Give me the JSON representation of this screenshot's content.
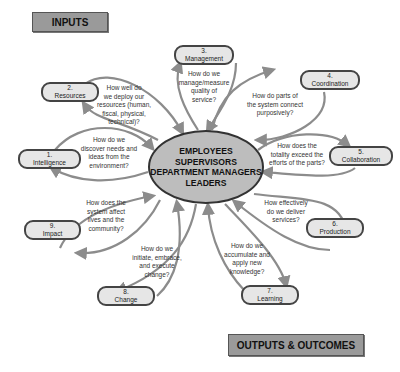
{
  "banners": {
    "inputs": "INPUTS",
    "outputs": "OUTPUTS & OUTCOMES"
  },
  "hub": {
    "lines": [
      "EMPLOYEES",
      "SUPERVISORS",
      "DEPARTMENT MANAGERS",
      "LEADERS"
    ]
  },
  "nodes": [
    {
      "num": "1.",
      "label": "Intelligence",
      "question": "How do we discover needs and ideas from the environment?"
    },
    {
      "num": "2.",
      "label": "Resources",
      "question": "How well do we deploy our resources (human, fiscal, physical, technical)?"
    },
    {
      "num": "3.",
      "label": "Management",
      "question": "How do we manage/measure quality of service?"
    },
    {
      "num": "4.",
      "label": "Coordination",
      "question": "How do parts of the system connect purposively?"
    },
    {
      "num": "5.",
      "label": "Collaboration",
      "question": "How does the totality exceed the efforts of the parts?"
    },
    {
      "num": "6.",
      "label": "Production",
      "question": "How effectively do we deliver services?"
    },
    {
      "num": "7.",
      "label": "Learning",
      "question": "How do we accumulate and apply new knowledge?"
    },
    {
      "num": "8.",
      "label": "Change",
      "question": "How do we initiate, embrace, and execute change?"
    },
    {
      "num": "9.",
      "label": "Impact",
      "question": "How does the system affect lives and the community?"
    }
  ],
  "questions_lines": {
    "q1": [
      "How do we",
      "discover needs and",
      "ideas from the",
      "environment?"
    ],
    "q2": [
      "How well do",
      "we deploy our",
      "resources (human,",
      "fiscal, physical,",
      "technical)?"
    ],
    "q3": [
      "How do we",
      "manage/measure",
      "quality of",
      "service?"
    ],
    "q4": [
      "How do parts of",
      "the system connect",
      "purposively?"
    ],
    "q5": [
      "How does the",
      "totality exceed the",
      "efforts of the parts?"
    ],
    "q6": [
      "How effectively",
      "do we deliver",
      "services?"
    ],
    "q7": [
      "How do we",
      "accumulate and",
      "apply new",
      "knowledge?"
    ],
    "q8": [
      "How do we",
      "initiate, embrace,",
      "and execute",
      "change?"
    ],
    "q9": [
      "How does the",
      "system affect",
      "lives and the",
      "community?"
    ]
  },
  "colors": {
    "banner_fill": "#9a9a9a",
    "node_fill": "#e6e6e6",
    "hub_fill": "#bdbdbd",
    "arrow": "#8c8c8c"
  }
}
